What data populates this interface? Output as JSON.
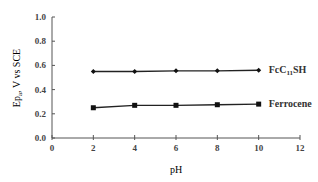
{
  "chart_data": {
    "type": "line",
    "title": "",
    "xlabel": "pH",
    "ylabel": "Ep, V vs SCE",
    "xlim": [
      0,
      12
    ],
    "ylim": [
      0.0,
      1.0
    ],
    "x_ticks": [
      "0",
      "2",
      "4",
      "6",
      "8",
      "10",
      "12"
    ],
    "y_ticks": [
      "0.0",
      "0.2",
      "0.4",
      "0.6",
      "0.8",
      "1.0"
    ],
    "grid": false,
    "legend_position": "inline labels at right end of lines",
    "x": [
      2,
      4,
      6,
      8,
      10
    ],
    "series": [
      {
        "name": "FcC11SH",
        "label_main": "FcC",
        "label_sub": "11",
        "label_tail": "SH",
        "marker": "diamond",
        "values": [
          0.55,
          0.55,
          0.555,
          0.555,
          0.56
        ]
      },
      {
        "name": "Ferrocene",
        "label_main": "Ferrocene",
        "marker": "square",
        "values": [
          0.25,
          0.27,
          0.27,
          0.275,
          0.28
        ]
      }
    ]
  }
}
